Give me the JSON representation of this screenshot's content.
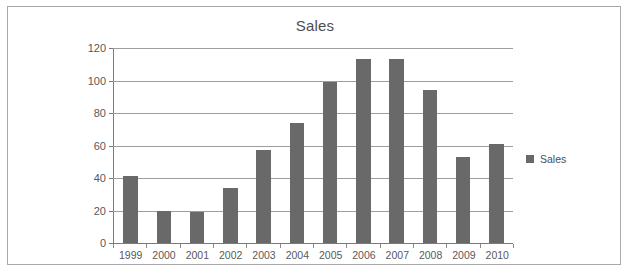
{
  "figure": {
    "background_color": "#ffffff",
    "border_color": "#a9a9a9"
  },
  "chart_data": {
    "type": "bar",
    "title": "Sales",
    "xlabel": "",
    "ylabel": "",
    "categories": [
      "1999",
      "2000",
      "2001",
      "2002",
      "2003",
      "2004",
      "2005",
      "2006",
      "2007",
      "2008",
      "2009",
      "2010"
    ],
    "values": [
      41,
      20,
      19,
      34,
      57,
      74,
      99,
      113,
      113,
      94,
      53,
      61
    ],
    "series": [
      {
        "name": "Sales",
        "color": "#696969",
        "values": [
          41,
          20,
          19,
          34,
          57,
          74,
          99,
          113,
          113,
          94,
          53,
          61
        ]
      }
    ],
    "ylim": [
      0,
      120
    ],
    "yticks": [
      0,
      20,
      40,
      60,
      80,
      100,
      120
    ],
    "ytick_labels": [
      "0",
      "20",
      "40",
      "60",
      "80",
      "100",
      "120"
    ],
    "grid": true,
    "grid_axis": "y",
    "grid_color": "#9e9e9e",
    "legend": {
      "position": "right",
      "entries": [
        {
          "label": "Sales",
          "color": "#696969"
        }
      ]
    }
  }
}
